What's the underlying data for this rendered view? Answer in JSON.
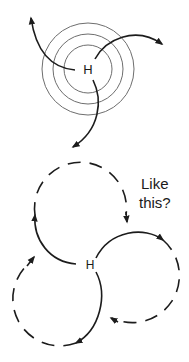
{
  "top_diagram": {
    "center_label": "H",
    "rings": 3,
    "arrows": 3
  },
  "bottom_diagram": {
    "center_label": "H",
    "question_line1": "Like",
    "question_line2": "this?",
    "circles": 3
  },
  "colors": {
    "ink": "#1c1c1c",
    "ring": "#6e6e6e",
    "background": "#ffffff"
  }
}
